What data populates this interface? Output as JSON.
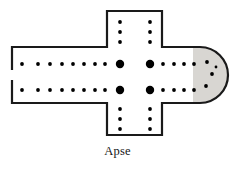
{
  "figure": {
    "caption": "Apse",
    "type": "architectural-floor-plan"
  },
  "style": {
    "wall_color": "#1a1a1a",
    "wall_width": 2.2,
    "apse_fill": "#d8d6d2",
    "interior_fill": "#ffffff",
    "column_color": "#000000",
    "background": "#ffffff",
    "small_column_radius": 1.9,
    "large_pier_radius": 4.2
  },
  "geometry": {
    "nave_top_y": 47,
    "nave_bottom_y": 104,
    "nave_left_x": 12,
    "west_gap_top_y": 70,
    "west_gap_bottom_y": 80,
    "transept_left_x": 107,
    "transept_right_x": 162,
    "transept_top_y": 11,
    "transept_bottom_y": 135,
    "chancel_right_x": 200,
    "apse_radius": 28,
    "apse_center_y": 75
  },
  "columns": {
    "nave_upper_row_y": 64,
    "nave_lower_row_y": 90,
    "nave_small_xs": [
      22,
      38,
      50,
      62,
      73,
      84,
      95,
      105
    ],
    "chancel_small_xs": [
      152,
      163,
      174,
      184,
      194
    ],
    "crossing_piers": [
      {
        "x": 120,
        "y": 64,
        "label": "northwest-pier"
      },
      {
        "x": 150,
        "y": 64,
        "label": "northeast-pier"
      },
      {
        "x": 120,
        "y": 90,
        "label": "southwest-pier"
      },
      {
        "x": 150,
        "y": 90,
        "label": "southeast-pier"
      }
    ],
    "transept_north_left_x": 120,
    "transept_north_right_x": 150,
    "transept_north_ys": [
      22,
      32,
      42
    ],
    "transept_south_ys": [
      109,
      119,
      129
    ],
    "apse_columns": [
      {
        "x": 207,
        "y": 62
      },
      {
        "x": 212,
        "y": 74
      },
      {
        "x": 206,
        "y": 86
      },
      {
        "x": 216,
        "y": 67
      }
    ]
  },
  "labels": {
    "apse": "Apse"
  }
}
